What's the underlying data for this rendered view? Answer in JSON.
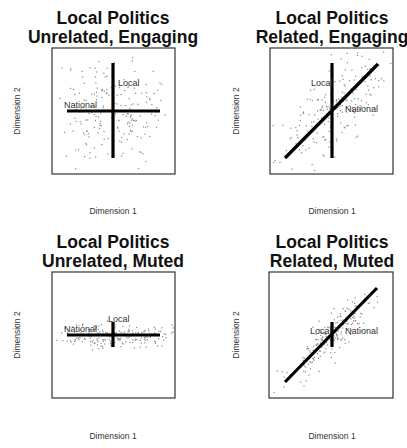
{
  "chart_data": [
    {
      "type": "scatter",
      "title": "Local Politics\nUnrelated, Engaging",
      "title_lines": [
        "Local Politics",
        "Unrelated, Engaging"
      ],
      "xlabel": "Dimension 1",
      "ylabel": "Dimension 2",
      "grid": false,
      "legend": null,
      "frame": {
        "x": 52,
        "y": 48,
        "w": 123,
        "h": 126
      },
      "lines": [
        {
          "name": "National",
          "x1": 67,
          "y1": 111,
          "x2": 160,
          "y2": 111
        },
        {
          "name": "Local",
          "x1": 113,
          "y1": 63,
          "x2": 113,
          "y2": 158
        }
      ],
      "annotations": [
        {
          "text": "Local",
          "x": 118,
          "y": 86
        },
        {
          "text": "National",
          "x": 64,
          "y": 108
        }
      ],
      "scatter": {
        "cx": 113,
        "cy": 111,
        "sx": 30,
        "sy": 27,
        "rho": 0.0,
        "n": 220,
        "seed": 11
      }
    },
    {
      "type": "scatter",
      "title": "Local Politics\nRelated, Engaging",
      "title_lines": [
        "Local Politics",
        "Related, Engaging"
      ],
      "xlabel": "Dimension 1",
      "ylabel": "Dimension 2",
      "grid": false,
      "legend": null,
      "frame": {
        "x": 270,
        "y": 48,
        "w": 123,
        "h": 126
      },
      "lines": [
        {
          "name": "National",
          "x1": 285,
          "y1": 158,
          "x2": 378,
          "y2": 64
        },
        {
          "name": "Local",
          "x1": 332,
          "y1": 63,
          "x2": 332,
          "y2": 158
        }
      ],
      "annotations": [
        {
          "text": "Local",
          "x": 311,
          "y": 86
        },
        {
          "text": "National",
          "x": 345,
          "y": 112
        }
      ],
      "scatter": {
        "cx": 332,
        "cy": 111,
        "sx": 28,
        "sy": 27,
        "rho": 0.72,
        "n": 220,
        "seed": 23
      }
    },
    {
      "type": "scatter",
      "title": "Local Politics\nUnrelated, Muted",
      "title_lines": [
        "Local Politics",
        "Unrelated, Muted"
      ],
      "xlabel": "Dimension 1",
      "ylabel": "Dimension 2",
      "grid": false,
      "legend": null,
      "frame": {
        "x": 52,
        "y": 272,
        "w": 123,
        "h": 126
      },
      "lines": [
        {
          "name": "National",
          "x1": 67,
          "y1": 335,
          "x2": 160,
          "y2": 335
        },
        {
          "name": "Local",
          "x1": 113,
          "y1": 322,
          "x2": 113,
          "y2": 347
        }
      ],
      "annotations": [
        {
          "text": "Local",
          "x": 108,
          "y": 322
        },
        {
          "text": "National",
          "x": 64,
          "y": 332
        }
      ],
      "scatter": {
        "cx": 113,
        "cy": 335,
        "sx": 28,
        "sy": 6,
        "rho": 0.0,
        "n": 220,
        "seed": 37
      }
    },
    {
      "type": "scatter",
      "title": "Local Politics\nRelated, Muted",
      "title_lines": [
        "Local Politics",
        "Related, Muted"
      ],
      "xlabel": "Dimension 1",
      "ylabel": "Dimension 2",
      "grid": false,
      "legend": null,
      "frame": {
        "x": 269,
        "y": 272,
        "w": 124,
        "h": 126
      },
      "lines": [
        {
          "name": "National",
          "x1": 285,
          "y1": 382,
          "x2": 377,
          "y2": 288
        },
        {
          "name": "Local",
          "x1": 332,
          "y1": 322,
          "x2": 332,
          "y2": 347
        }
      ],
      "annotations": [
        {
          "text": "Local",
          "x": 310,
          "y": 334
        },
        {
          "text": "National",
          "x": 345,
          "y": 334
        }
      ],
      "scatter": {
        "cx": 332,
        "cy": 335,
        "sx": 22,
        "sy": 22,
        "rho": 0.88,
        "n": 220,
        "seed": 53
      }
    }
  ],
  "layout": {
    "title_center_x": [
      113,
      332,
      113,
      332
    ],
    "title_y": [
      [
        24,
        43
      ],
      [
        24,
        43
      ],
      [
        248,
        267
      ],
      [
        248,
        267
      ]
    ],
    "xlabel_pos": [
      [
        113,
        214
      ],
      [
        332,
        214
      ],
      [
        113,
        439
      ],
      [
        332,
        439
      ]
    ],
    "ylabel_pos": [
      [
        20,
        111
      ],
      [
        239,
        111
      ],
      [
        20,
        335
      ],
      [
        239,
        335
      ]
    ]
  }
}
